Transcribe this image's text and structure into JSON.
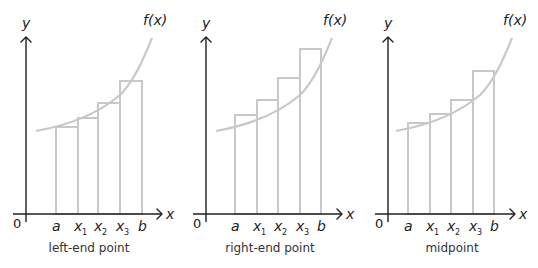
{
  "figure": {
    "panels": [
      {
        "id": "left",
        "caption": "left-end point",
        "origin_label": "0",
        "x_axis_label": "x",
        "y_axis_label": "y",
        "function_label": "f(x)",
        "tick_labels": [
          "a",
          "x",
          "x",
          "x",
          "b"
        ],
        "tick_subscripts": [
          "",
          "1",
          "2",
          "3",
          ""
        ],
        "geometry": {
          "yaxis_x": 26,
          "xaxis_y": 214,
          "xaxis_start": 13,
          "xaxis_end": 162,
          "yaxis_top": 37,
          "ticks_x": [
            56,
            78,
            98,
            120,
            142
          ],
          "rect_tops": [
            127,
            118,
            103,
            81
          ],
          "curve": "M36,131 C70,125 100,112 120,95 C135,80 145,55 152,38",
          "flabel_x": 143,
          "flabel_y": 25,
          "caption_x": 89
        }
      },
      {
        "id": "right",
        "caption": "right-end point",
        "origin_label": "0",
        "x_axis_label": "x",
        "y_axis_label": "y",
        "function_label": "f(x)",
        "tick_labels": [
          "a",
          "x",
          "x",
          "x",
          "b"
        ],
        "tick_subscripts": [
          "",
          "1",
          "2",
          "3",
          ""
        ],
        "geometry": {
          "yaxis_x": 206,
          "xaxis_y": 214,
          "xaxis_start": 193,
          "xaxis_end": 342,
          "yaxis_top": 37,
          "ticks_x": [
            235,
            257,
            278,
            300,
            321
          ],
          "rect_tops": [
            115,
            100,
            78,
            49
          ],
          "curve": "M216,131 C250,125 280,112 300,95 C315,80 325,55 332,38",
          "flabel_x": 323,
          "flabel_y": 25,
          "caption_x": 270
        }
      },
      {
        "id": "mid",
        "caption": "midpoint",
        "origin_label": "0",
        "x_axis_label": "x",
        "y_axis_label": "y",
        "function_label": "f(x)",
        "tick_labels": [
          "a",
          "x",
          "x",
          "x",
          "b"
        ],
        "tick_subscripts": [
          "",
          "1",
          "2",
          "3",
          ""
        ],
        "geometry": {
          "yaxis_x": 388,
          "xaxis_y": 214,
          "xaxis_start": 375,
          "xaxis_end": 515,
          "yaxis_top": 37,
          "ticks_x": [
            408,
            430,
            451,
            473,
            494
          ],
          "rect_tops": [
            123,
            114,
            100,
            71
          ],
          "curve": "M396,131 C430,125 460,112 480,95 C495,80 505,55 512,38",
          "flabel_x": 503,
          "flabel_y": 25,
          "caption_x": 452
        }
      }
    ],
    "colors": {
      "axis": "#1e1e1e",
      "curve": "#c8c8c8",
      "rectangles": "#c8c8c8",
      "text": "#222222"
    }
  }
}
